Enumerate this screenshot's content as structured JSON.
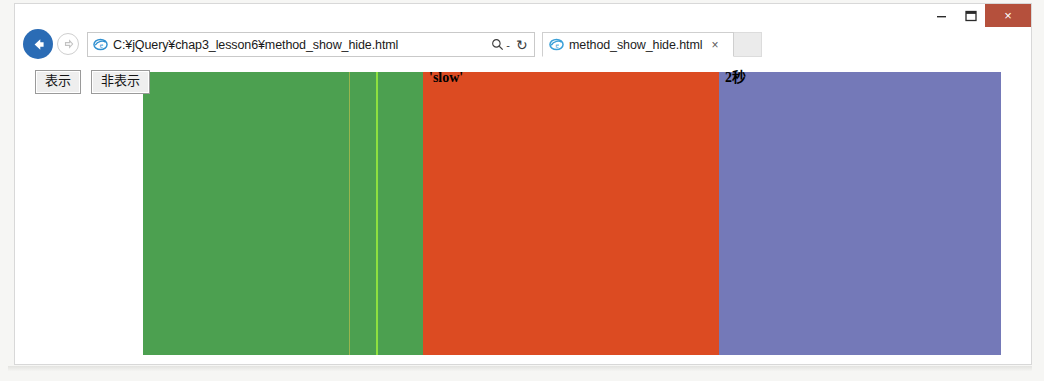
{
  "window": {
    "title": "",
    "controls": {
      "minimize_label": "–",
      "maximize_label": "❐",
      "close_label": "×"
    }
  },
  "navigation": {
    "back_icon": "back-arrow-icon",
    "forward_icon": "forward-arrow-icon",
    "address": {
      "value": "C:¥jQuery¥chap3_lesson6¥method_show_hide.html",
      "favicon": "internet-explorer-icon",
      "search_icon": "search-icon",
      "refresh_icon": "refresh-icon",
      "refresh_glyph": "↻"
    }
  },
  "tabs": [
    {
      "title": "method_show_hide.html",
      "favicon": "internet-explorer-icon",
      "close_glyph": "×",
      "active": true
    }
  ],
  "toolbar_icons": [
    {
      "name": "home-icon"
    },
    {
      "name": "favorites-star-icon"
    },
    {
      "name": "settings-gear-icon"
    }
  ],
  "page": {
    "buttons": [
      {
        "label": "表示",
        "name": "show-button"
      },
      {
        "label": "非表示",
        "name": "hide-button"
      }
    ],
    "blocks": [
      {
        "name": "green-block",
        "label": "",
        "color": "#4CA050"
      },
      {
        "name": "orange-block",
        "label": "'slow'",
        "color": "#DC4B22"
      },
      {
        "name": "purple-block",
        "label": "2秒",
        "color": "#7479B8"
      }
    ]
  },
  "colors": {
    "green": "#4CA050",
    "orange": "#DC4B22",
    "purple": "#7479B8",
    "back_button": "#2b6cb5",
    "close_button": "#b5503c",
    "bright_line": "#8ee03f",
    "olive_line": "#a6b84e"
  }
}
